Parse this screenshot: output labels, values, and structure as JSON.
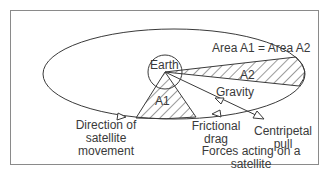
{
  "diagram": {
    "labels": {
      "earth": "Earth",
      "area_equation": "Area A1 = Area A2",
      "a1": "A1",
      "a2": "A2",
      "gravity": "Gravity",
      "direction_line1": "Direction of",
      "direction_line2": "satellite",
      "direction_line3": "movement",
      "frictional_line1": "Frictional",
      "frictional_line2": "drag",
      "centripetal_line1": "Centripetal",
      "centripetal_line2": "pull",
      "caption_line1": "Forces acting on a",
      "caption_line2": "satellite"
    },
    "colors": {
      "stroke": "#3a3a3a",
      "frame": "#8a8a8a",
      "background": "#ffffff"
    }
  }
}
